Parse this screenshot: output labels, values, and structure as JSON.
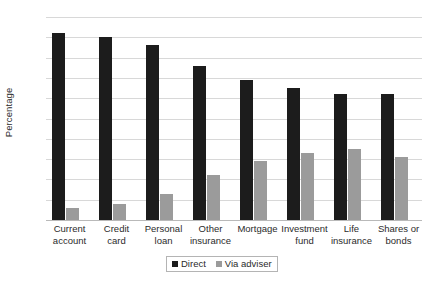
{
  "chart_data": {
    "type": "bar",
    "title": "",
    "subtitle": "",
    "xlabel": "",
    "ylabel": "Percentage",
    "ylim": [
      0,
      100
    ],
    "ytick_step": 10,
    "yticks": [
      0,
      10,
      20,
      30,
      40,
      50,
      60,
      70,
      80,
      90,
      100
    ],
    "ytick_labels": [
      "0",
      "10",
      "20",
      "30",
      "40",
      "50",
      "60",
      "70",
      "80",
      "90",
      "100"
    ],
    "grid": "horizontal",
    "legend_position": "bottom-center",
    "categories": [
      "Current account",
      "Credit card",
      "Personal loan",
      "Other insurance",
      "Mortgage",
      "Investment fund",
      "Life insurance",
      "Shares or bonds"
    ],
    "category_lines": [
      [
        "Current",
        "account"
      ],
      [
        "Credit",
        "card"
      ],
      [
        "Personal",
        "loan"
      ],
      [
        "Other",
        "insurance"
      ],
      [
        "Mortgage",
        ""
      ],
      [
        "Investment",
        "fund"
      ],
      [
        "Life",
        "insurance"
      ],
      [
        "Shares or",
        "bonds"
      ]
    ],
    "series": [
      {
        "name": "Direct",
        "color": "#1c1c1c",
        "values": [
          92,
          90,
          86,
          76,
          69,
          65,
          62,
          62
        ]
      },
      {
        "name": "Via adviser",
        "color": "#9b9b9b",
        "values": [
          6,
          8,
          13,
          22,
          29,
          33,
          35,
          31
        ]
      }
    ],
    "annotations": []
  },
  "legend": {
    "items": [
      {
        "label": "Direct",
        "swatch_name": "legend-swatch-direct"
      },
      {
        "label": "Via adviser",
        "swatch_name": "legend-swatch-via-adviser"
      }
    ]
  },
  "colors": {
    "direct": "#1c1c1c",
    "via_adviser": "#9b9b9b",
    "gridline": "#d8d8d8",
    "axis": "#b9b9b9",
    "text": "#2b2b2b",
    "background": "#ffffff"
  }
}
